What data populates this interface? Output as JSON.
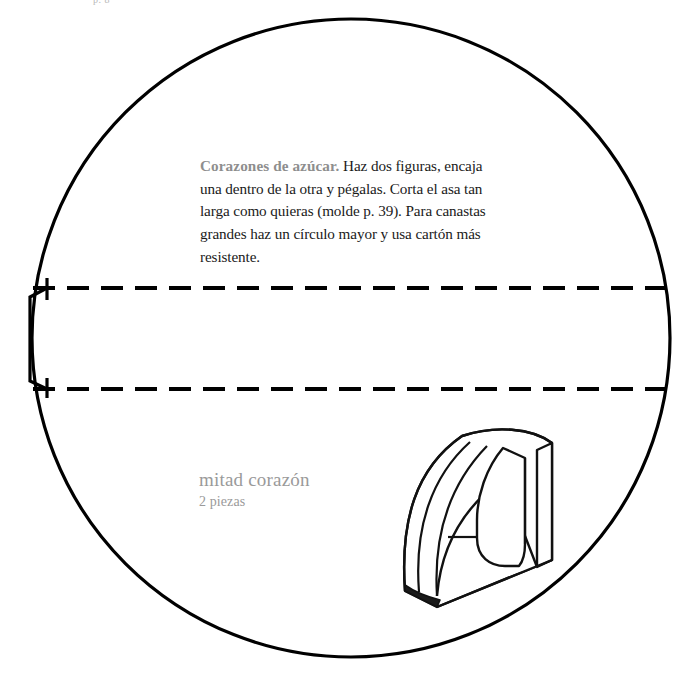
{
  "page": {
    "width": 678,
    "height": 674,
    "background_color": "#ffffff",
    "header_text": "p. 8",
    "ink_color": "#000000",
    "gray_text_color": "#8e8e8e",
    "label_gray_color": "#9a9a9a"
  },
  "instructions": {
    "lead": "Corazones de azúcar.",
    "body": " Haz dos figuras, encaja una dentro de la otra y pégalas. Corta el asa tan larga como quieras (molde p. 39). Para canastas grandes haz un círculo mayor y usa cartón más resistente."
  },
  "piece_label": {
    "title": "mitad corazón",
    "subtitle": "2 piezas"
  },
  "template": {
    "circle": {
      "center_x": 351,
      "center_y": 338,
      "radius": 319,
      "stroke_width": 3.2,
      "stroke_color": "#000000"
    },
    "fold_lines": [
      {
        "name": "upper-fold-line",
        "y": 288,
        "x_start": 33,
        "x_end": 670
      },
      {
        "name": "lower-fold-line",
        "y": 389,
        "x_start": 33,
        "x_end": 670
      }
    ],
    "dash_pattern": "22 12",
    "glue_tab": {
      "name": "glue-tab",
      "left_x": 28,
      "top_y": 288,
      "bottom_y": 389,
      "right_x": 47,
      "inset": 8
    }
  },
  "illustration": {
    "name": "heart-half-3d-drawing",
    "description": "line drawing of nested heart-half card pieces in perspective",
    "stroke_color": "#111111",
    "fill_color": "#ffffff",
    "shadow_fill": "#1a1a1a"
  }
}
